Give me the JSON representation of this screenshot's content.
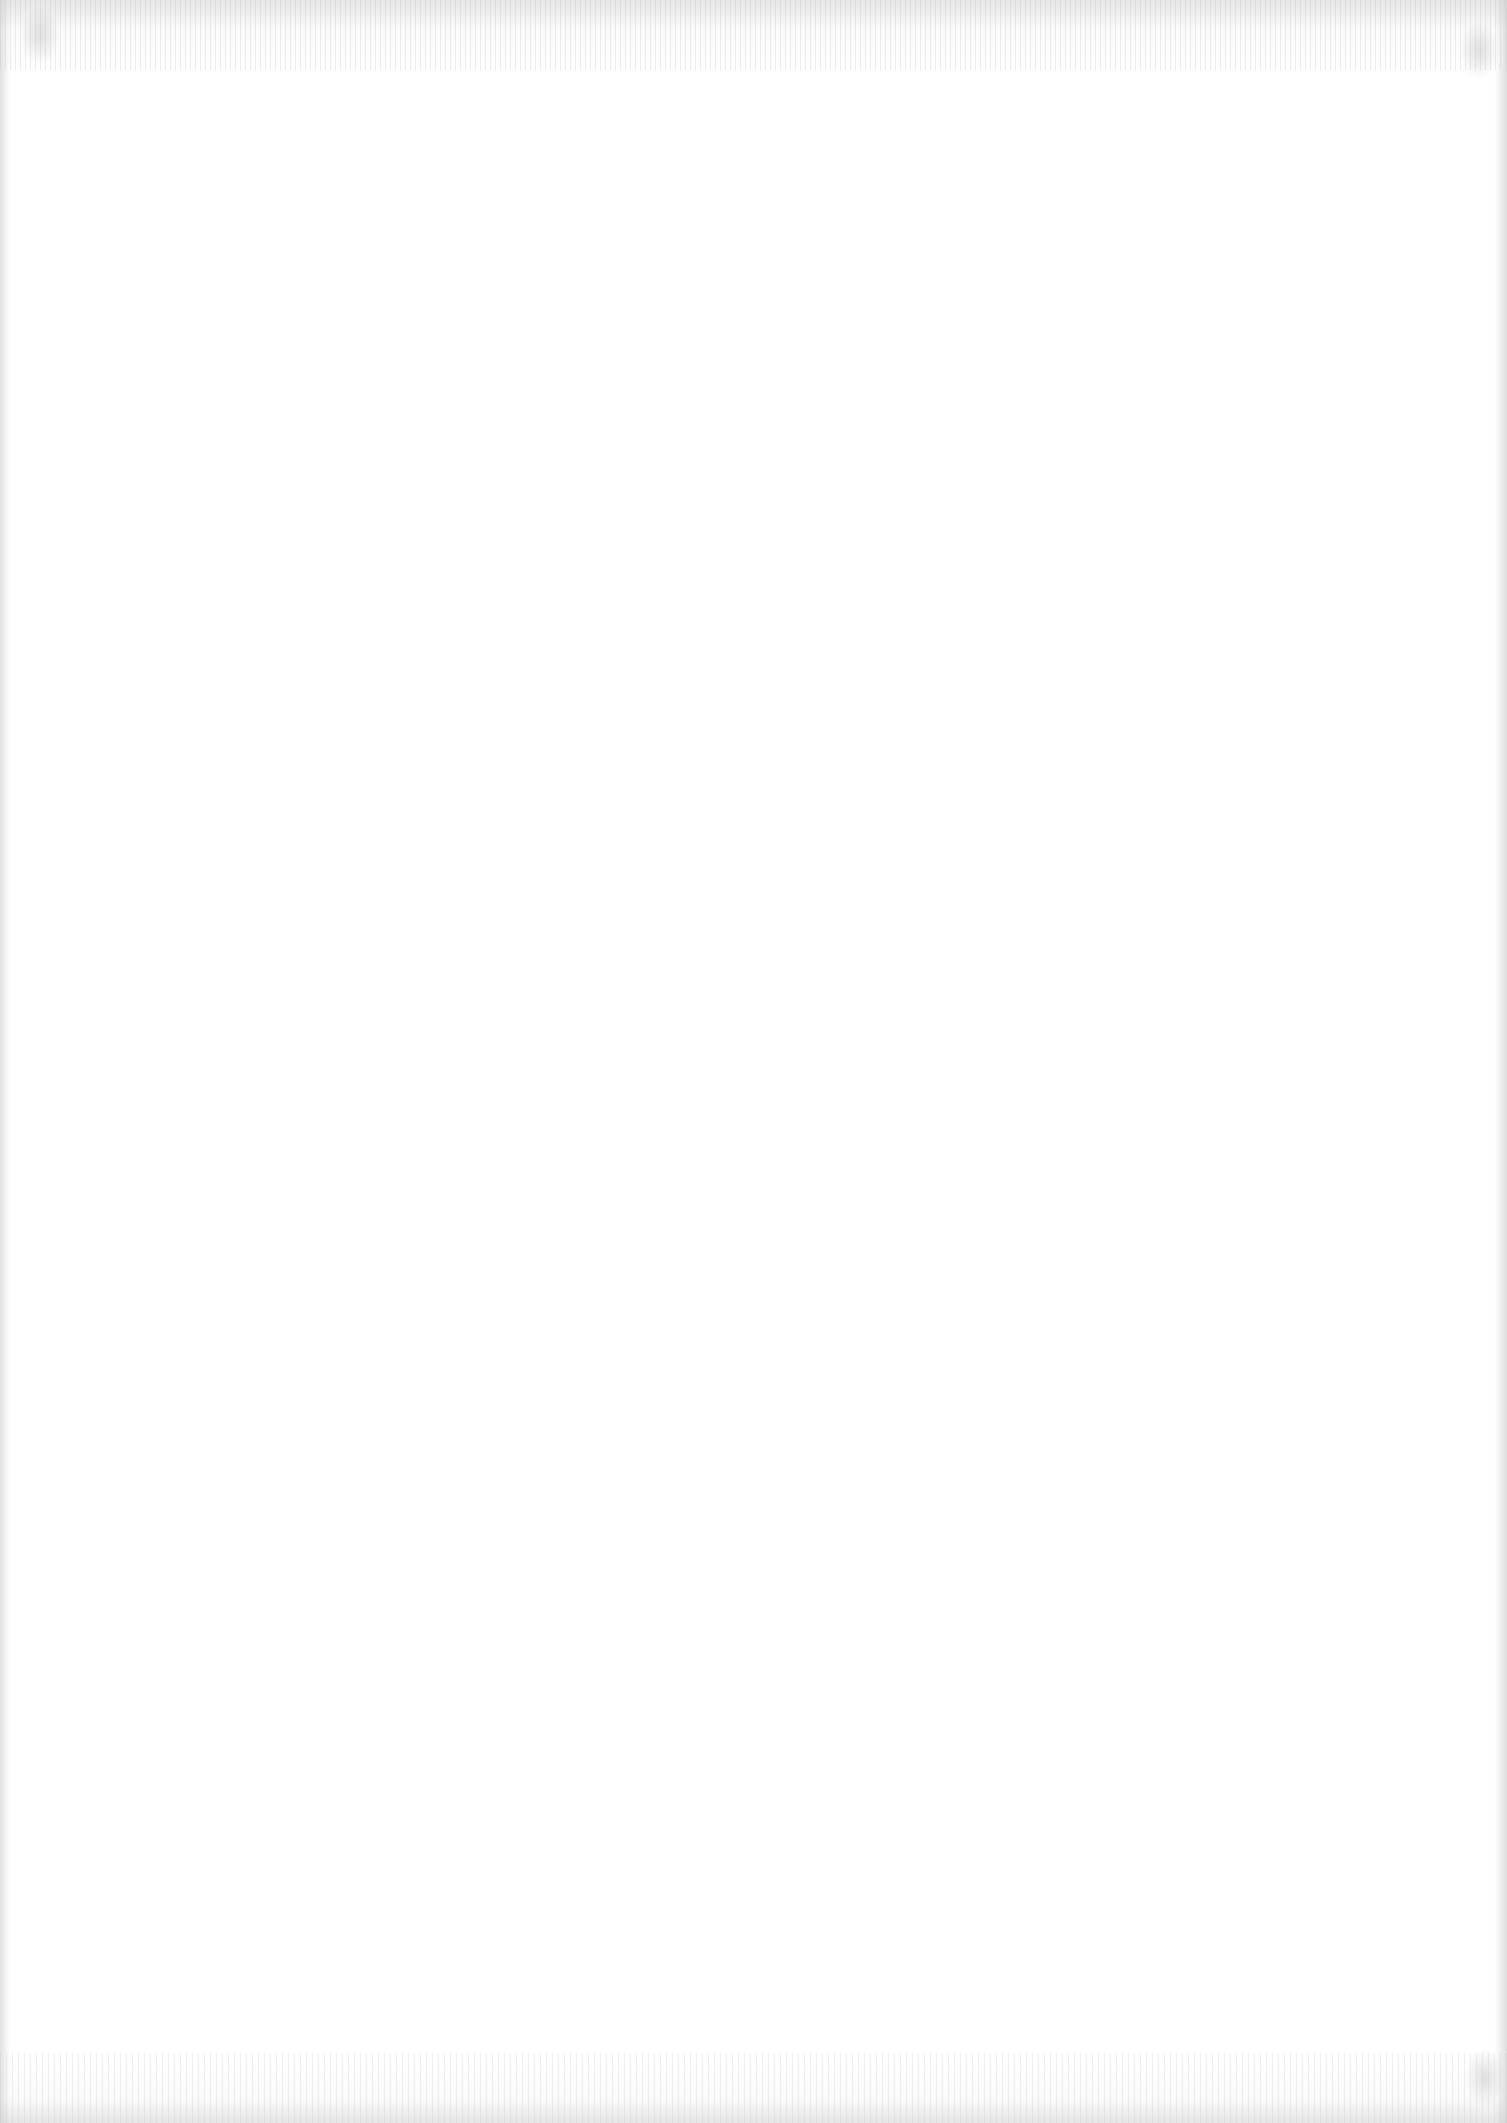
{
  "page": {
    "type": "blank-scanned-page",
    "text_content": [],
    "background_color": "#ffffff",
    "scan_artifact_color": "#bdbdbd"
  }
}
